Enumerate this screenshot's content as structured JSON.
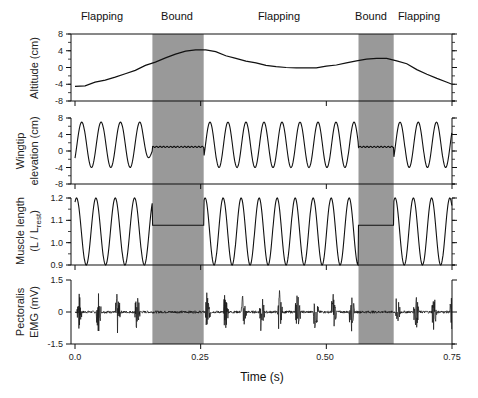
{
  "chart_data": {
    "type": "line",
    "title": "",
    "xlabel": "Time (s)",
    "x_ticks": [
      "0.0",
      "0.25",
      "0.50",
      "0.75"
    ],
    "xlim": [
      0.0,
      0.75
    ],
    "phases": [
      {
        "label": "Flapping",
        "start": 0.0,
        "end": 0.154
      },
      {
        "label": "Bound",
        "start": 0.154,
        "end": 0.256
      },
      {
        "label": "Flapping",
        "start": 0.256,
        "end": 0.564
      },
      {
        "label": "Bound",
        "start": 0.564,
        "end": 0.634
      },
      {
        "label": "Flapping",
        "start": 0.634,
        "end": 0.75
      }
    ],
    "shaded_regions": [
      [
        0.154,
        0.256
      ],
      [
        0.564,
        0.634
      ]
    ],
    "shade_color": "#999999",
    "panels": [
      {
        "name": "altitude",
        "ylabel": [
          "Altitude (cm)"
        ],
        "ylim": [
          -8,
          8
        ],
        "y_ticks": [
          "8",
          "4",
          "0",
          "-4",
          "-8"
        ],
        "y_tick_values": [
          8,
          4,
          0,
          -4,
          -8
        ],
        "series": {
          "x": [
            0.0,
            0.02,
            0.04,
            0.06,
            0.08,
            0.1,
            0.12,
            0.14,
            0.16,
            0.18,
            0.2,
            0.22,
            0.24,
            0.26,
            0.28,
            0.3,
            0.32,
            0.34,
            0.36,
            0.38,
            0.4,
            0.42,
            0.44,
            0.46,
            0.48,
            0.5,
            0.52,
            0.54,
            0.56,
            0.58,
            0.6,
            0.62,
            0.64,
            0.66,
            0.68,
            0.7,
            0.72,
            0.74,
            0.75
          ],
          "y": [
            -4.5,
            -4.4,
            -3.5,
            -3.0,
            -2.3,
            -1.5,
            -0.7,
            0.5,
            1.3,
            2.3,
            3.2,
            3.9,
            4.2,
            4.2,
            3.8,
            2.8,
            2.2,
            1.5,
            1.1,
            0.5,
            0.2,
            0.0,
            -0.1,
            -0.1,
            -0.1,
            0.3,
            0.6,
            1.1,
            1.6,
            2.0,
            2.2,
            2.2,
            1.6,
            0.9,
            -0.5,
            -1.6,
            -2.6,
            -3.5,
            -4.0
          ]
        }
      },
      {
        "name": "wingtip_elevation",
        "ylabel": [
          "Wingtip",
          "elevation (cm)"
        ],
        "ylim": [
          -8,
          8
        ],
        "y_ticks": [
          "8",
          "4",
          "0",
          "-4",
          "-8"
        ],
        "y_tick_values": [
          8,
          4,
          0,
          -4,
          -8
        ],
        "flapping_cycles_per_segment": [
          4,
          9,
          3
        ],
        "amplitude_cm": 5.5,
        "offset_cm": 1.5,
        "bound_level_cm": 1.0
      },
      {
        "name": "muscle_length",
        "ylabel": [
          "Muscle length",
          "(L / L_rest)"
        ],
        "ylim": [
          0.9,
          1.2
        ],
        "y_ticks": [
          "1.2",
          "1.1",
          "1.0",
          "0.9"
        ],
        "y_tick_values": [
          1.2,
          1.1,
          1.0,
          0.9
        ],
        "flapping_min": 0.9,
        "flapping_max": 1.2,
        "bound_level": [
          1.08,
          1.08
        ]
      },
      {
        "name": "pectoralis_emg",
        "ylabel": [
          "Pectoralis",
          "EMG (mV)"
        ],
        "ylim": [
          -1.5,
          1.5
        ],
        "y_ticks": [
          "1.5",
          "0",
          "-1.5"
        ],
        "y_tick_values": [
          1.5,
          0,
          -1.5
        ],
        "burst_peak_mV": 1.3
      }
    ]
  },
  "labels": {
    "phase_1": "Flapping",
    "phase_2": "Bound",
    "phase_3": "Flapping",
    "phase_4": "Bound",
    "phase_5": "Flapping",
    "xaxis_title": "Time (s)",
    "x_tick_0": "0.0",
    "x_tick_1": "0.25",
    "x_tick_2": "0.50",
    "x_tick_3": "0.75",
    "p1_ylabel": "Altitude (cm)",
    "p2_ylabel_1": "Wingtip",
    "p2_ylabel_2": "elevation (cm)",
    "p3_ylabel_1": "Muscle length",
    "p3_ylabel_2a": "(L / L",
    "p3_ylabel_2sub": "rest",
    "p3_ylabel_2b": ")",
    "p4_ylabel_1": "Pectoralis",
    "p4_ylabel_2": "EMG (mV)",
    "p1_ticks": [
      "8",
      "4",
      "0",
      "-4",
      "-8"
    ],
    "p2_ticks": [
      "8",
      "4",
      "0",
      "-4",
      "-8"
    ],
    "p3_ticks": [
      "1.2",
      "1.1",
      "1.0",
      "0.9"
    ],
    "p4_ticks": [
      "1.5",
      "0",
      "-1.5"
    ]
  }
}
